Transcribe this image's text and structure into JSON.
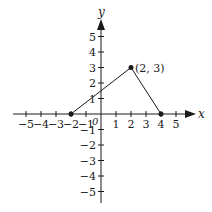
{
  "chart_data": {
    "type": "line",
    "title": "",
    "xlabel": "x",
    "ylabel": "y",
    "xlim": [
      -5,
      5
    ],
    "ylim": [
      -5,
      5
    ],
    "grid": false,
    "x_ticks": [
      -5,
      -4,
      -3,
      -2,
      -1,
      1,
      2,
      3,
      4,
      5
    ],
    "y_ticks": [
      -5,
      -4,
      -3,
      -2,
      -1,
      1,
      2,
      3,
      4,
      5
    ],
    "origin_label": "0",
    "series": [
      {
        "name": "piecewise",
        "points": [
          [
            -2,
            0
          ],
          [
            2,
            3
          ],
          [
            4,
            0
          ]
        ],
        "markers": true
      }
    ],
    "annotations": [
      {
        "text": "(2, 3)",
        "x": 2,
        "y": 3
      }
    ]
  },
  "labels": {
    "x_axis": "x",
    "y_axis": "y",
    "origin": "0",
    "point_label": "(2, 3)",
    "x_tick_labels": [
      "−5",
      "−4",
      "−3",
      "−2",
      "−1",
      "1",
      "2",
      "3",
      "4",
      "5"
    ],
    "y_tick_labels": [
      "5",
      "4",
      "3",
      "2",
      "1",
      "−1",
      "−2",
      "−3",
      "−4",
      "−5"
    ]
  },
  "colors": {
    "ink": "#1a1a1a",
    "background": "#ffffff"
  }
}
